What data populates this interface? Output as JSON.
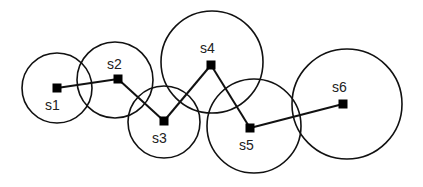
{
  "diagram": {
    "type": "sensor-network-path",
    "stroke_color": "#111111",
    "node_color": "#000000",
    "background": "#ffffff",
    "nodes": [
      {
        "id": "s1",
        "label": "s1",
        "x": 57,
        "y": 88,
        "circle": {
          "cx": 57,
          "cy": 88,
          "r": 35
        },
        "label_x": 45,
        "label_y": 110
      },
      {
        "id": "s2",
        "label": "s2",
        "x": 118,
        "y": 79,
        "circle": {
          "cx": 115,
          "cy": 80,
          "r": 38
        },
        "label_x": 107,
        "label_y": 69
      },
      {
        "id": "s3",
        "label": "s3",
        "x": 164,
        "y": 121,
        "circle": {
          "cx": 164,
          "cy": 122,
          "r": 36
        },
        "label_x": 152,
        "label_y": 143
      },
      {
        "id": "s4",
        "label": "s4",
        "x": 211,
        "y": 65,
        "circle": {
          "cx": 212,
          "cy": 62,
          "r": 51
        },
        "label_x": 200,
        "label_y": 53
      },
      {
        "id": "s5",
        "label": "s5",
        "x": 250,
        "y": 128,
        "circle": {
          "cx": 254,
          "cy": 126,
          "r": 47
        },
        "label_x": 239,
        "label_y": 150
      },
      {
        "id": "s6",
        "label": "s6",
        "x": 343,
        "y": 104,
        "circle": {
          "cx": 347,
          "cy": 104,
          "r": 55
        },
        "label_x": 332,
        "label_y": 92
      }
    ],
    "edges": [
      {
        "from": "s1",
        "to": "s2"
      },
      {
        "from": "s2",
        "to": "s3"
      },
      {
        "from": "s3",
        "to": "s4"
      },
      {
        "from": "s4",
        "to": "s5"
      },
      {
        "from": "s5",
        "to": "s6"
      }
    ]
  }
}
